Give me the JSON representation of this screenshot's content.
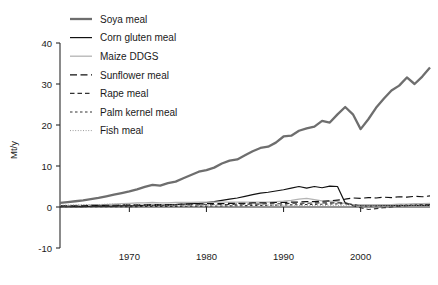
{
  "chart_data": {
    "type": "line",
    "title": "",
    "xlabel": "",
    "ylabel": "Mt/y",
    "xlim": [
      1961,
      2009
    ],
    "ylim": [
      -10,
      40
    ],
    "yticks": [
      -10,
      0,
      10,
      20,
      30,
      40
    ],
    "ytick_labels": [
      "-10",
      "0",
      "10",
      "20",
      "30",
      "40"
    ],
    "xticks": [
      1970,
      1980,
      1990,
      2000
    ],
    "xtick_labels": [
      "1970",
      "1980",
      "1990",
      "2000"
    ],
    "grid": false,
    "legend_position": "upper-left-inside",
    "x": [
      1961,
      1962,
      1963,
      1964,
      1965,
      1966,
      1967,
      1968,
      1969,
      1970,
      1971,
      1972,
      1973,
      1974,
      1975,
      1976,
      1977,
      1978,
      1979,
      1980,
      1981,
      1982,
      1983,
      1984,
      1985,
      1986,
      1987,
      1988,
      1989,
      1990,
      1991,
      1992,
      1993,
      1994,
      1995,
      1996,
      1997,
      1998,
      1999,
      2000,
      2001,
      2002,
      2003,
      2004,
      2005,
      2006,
      2007,
      2008,
      2009
    ],
    "series": [
      {
        "name": "Soya meal",
        "style": "solid-thick",
        "color": "#6e6e6e",
        "width": 2.3,
        "values": [
          1.0,
          1.2,
          1.4,
          1.6,
          1.9,
          2.2,
          2.6,
          3.0,
          3.4,
          3.8,
          4.3,
          4.9,
          5.4,
          5.2,
          5.8,
          6.2,
          7.0,
          7.8,
          8.6,
          9.0,
          9.6,
          10.6,
          11.3,
          11.6,
          12.6,
          13.6,
          14.4,
          14.7,
          15.7,
          17.2,
          17.4,
          18.6,
          19.2,
          19.6,
          21.0,
          20.6,
          22.6,
          24.4,
          22.6,
          19.0,
          21.4,
          24.2,
          26.4,
          28.4,
          29.6,
          31.6,
          30.0,
          31.8,
          34.0
        ]
      },
      {
        "name": "Corn gluten meal",
        "style": "solid-thin",
        "color": "#111111",
        "width": 1.2,
        "values": [
          0.1,
          0.1,
          0.1,
          0.1,
          0.2,
          0.2,
          0.2,
          0.2,
          0.3,
          0.3,
          0.3,
          0.4,
          0.4,
          0.4,
          0.5,
          0.6,
          0.7,
          0.8,
          0.9,
          1.1,
          1.3,
          1.6,
          1.9,
          2.2,
          2.6,
          3.0,
          3.4,
          3.6,
          3.9,
          4.2,
          4.6,
          5.0,
          4.6,
          5.0,
          4.7,
          5.1,
          5.0,
          1.0,
          0.5,
          0.4,
          0.4,
          0.4,
          0.4,
          0.4,
          0.4,
          0.4,
          0.4,
          0.4,
          0.4
        ]
      },
      {
        "name": "Maize DDGS",
        "style": "solid-light",
        "color": "#b4b4b4",
        "width": 1.3,
        "values": [
          0.3,
          0.3,
          0.4,
          0.4,
          0.5,
          0.5,
          0.6,
          0.7,
          0.8,
          0.9,
          1.0,
          1.0,
          1.1,
          1.0,
          1.0,
          1.1,
          1.1,
          1.1,
          1.2,
          1.2,
          1.2,
          1.2,
          1.2,
          1.2,
          1.2,
          1.2,
          1.2,
          1.2,
          1.3,
          1.4,
          1.6,
          1.9,
          2.1,
          1.8,
          1.5,
          1.4,
          1.3,
          0.8,
          0.6,
          0.5,
          0.5,
          0.5,
          0.6,
          0.6,
          0.7,
          0.7,
          0.8,
          0.8,
          0.9
        ]
      },
      {
        "name": "Sunflower meal",
        "style": "dash-long",
        "color": "#111111",
        "width": 1.2,
        "values": [
          0.3,
          0.3,
          0.3,
          0.3,
          0.4,
          0.4,
          0.4,
          0.4,
          0.5,
          0.5,
          0.5,
          0.5,
          0.6,
          0.6,
          0.6,
          0.6,
          0.7,
          0.7,
          0.7,
          0.8,
          0.8,
          0.8,
          0.9,
          0.9,
          0.9,
          1.0,
          1.0,
          1.0,
          1.1,
          1.1,
          1.2,
          1.2,
          1.3,
          1.3,
          1.4,
          1.5,
          1.7,
          1.9,
          2.2,
          2.1,
          2.3,
          2.2,
          2.4,
          2.3,
          2.5,
          2.4,
          2.6,
          2.5,
          2.7
        ]
      },
      {
        "name": "Rape meal",
        "style": "dash-medium",
        "color": "#333333",
        "width": 1.1,
        "values": [
          0.2,
          0.2,
          0.2,
          0.2,
          0.2,
          0.3,
          0.3,
          0.3,
          0.3,
          0.3,
          0.4,
          0.4,
          0.4,
          0.4,
          0.4,
          0.5,
          0.5,
          0.5,
          0.5,
          0.6,
          0.6,
          0.6,
          0.6,
          0.7,
          0.7,
          0.7,
          0.7,
          0.8,
          0.8,
          0.8,
          0.9,
          0.9,
          0.9,
          1.0,
          1.0,
          1.0,
          1.0,
          1.0,
          0.3,
          -0.2,
          -0.6,
          -0.4,
          -0.2,
          0.0,
          0.2,
          0.3,
          0.4,
          0.5,
          0.6
        ]
      },
      {
        "name": "Palm kernel meal",
        "style": "dash-short",
        "color": "#333333",
        "width": 1.1,
        "values": [
          0.05,
          0.05,
          0.06,
          0.06,
          0.07,
          0.07,
          0.08,
          0.08,
          0.09,
          0.1,
          0.1,
          0.11,
          0.12,
          0.13,
          0.14,
          0.15,
          0.17,
          0.18,
          0.2,
          0.22,
          0.24,
          0.26,
          0.28,
          0.3,
          0.33,
          0.36,
          0.39,
          0.42,
          0.45,
          0.48,
          0.52,
          0.56,
          0.6,
          0.64,
          0.68,
          0.72,
          0.76,
          0.8,
          0.6,
          0.3,
          0.2,
          0.25,
          0.3,
          0.35,
          0.4,
          0.45,
          0.5,
          0.55,
          0.6
        ]
      },
      {
        "name": "Fish meal",
        "style": "dotted",
        "color": "#9a9a9a",
        "width": 1.0,
        "values": [
          0.4,
          0.5,
          0.5,
          0.6,
          0.6,
          0.6,
          0.7,
          0.7,
          0.6,
          0.6,
          0.7,
          0.5,
          0.4,
          0.5,
          0.4,
          0.5,
          0.4,
          0.5,
          0.5,
          0.5,
          0.5,
          0.5,
          0.4,
          0.5,
          0.5,
          0.5,
          0.5,
          0.5,
          0.4,
          0.4,
          0.4,
          0.4,
          0.4,
          0.4,
          0.4,
          0.4,
          0.4,
          0.3,
          0.3,
          0.3,
          0.3,
          0.3,
          0.3,
          0.3,
          0.3,
          0.3,
          0.3,
          0.3,
          0.3
        ]
      }
    ]
  },
  "legend": {
    "items": [
      {
        "label": "Soya meal"
      },
      {
        "label": "Corn gluten meal"
      },
      {
        "label": "Maize DDGS"
      },
      {
        "label": "Sunflower meal"
      },
      {
        "label": "Rape meal"
      },
      {
        "label": "Palm kernel meal"
      },
      {
        "label": "Fish meal"
      }
    ]
  }
}
